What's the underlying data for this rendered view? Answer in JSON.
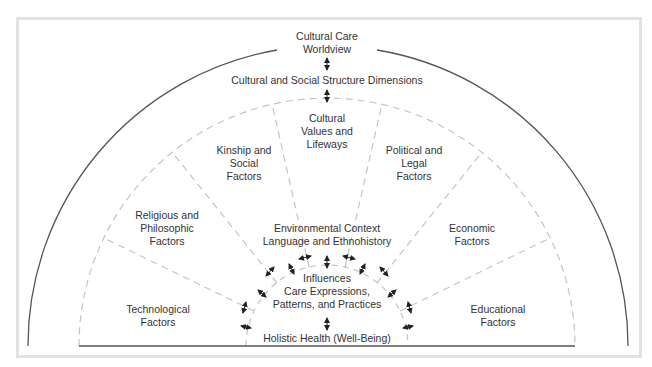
{
  "diagram": {
    "worldview": "Cultural Care\nWorldview",
    "dimensions": "Cultural and Social Structure Dimensions",
    "sectors": [
      {
        "id": "technological",
        "label": "Technological\nFactors"
      },
      {
        "id": "religious",
        "label": "Religious and\nPhilosophic\nFactors"
      },
      {
        "id": "kinship",
        "label": "Kinship and\nSocial\nFactors"
      },
      {
        "id": "cultural-values",
        "label": "Cultural\nValues and\nLifeways"
      },
      {
        "id": "political",
        "label": "Political and\nLegal\nFactors"
      },
      {
        "id": "economic",
        "label": "Economic\nFactors"
      },
      {
        "id": "educational",
        "label": "Educational\nFactors"
      }
    ],
    "environmental": "Environmental Context\nLanguage and Ethnohistory",
    "influences": "Influences",
    "care_expressions": "Care Expressions,\nPatterns, and Practices",
    "holistic_health": "Holistic Health (Well-Being)"
  },
  "colors": {
    "line": "#555555",
    "dashed": "#c4c4c4",
    "frame": "#e2e2e2",
    "text": "#333333"
  }
}
